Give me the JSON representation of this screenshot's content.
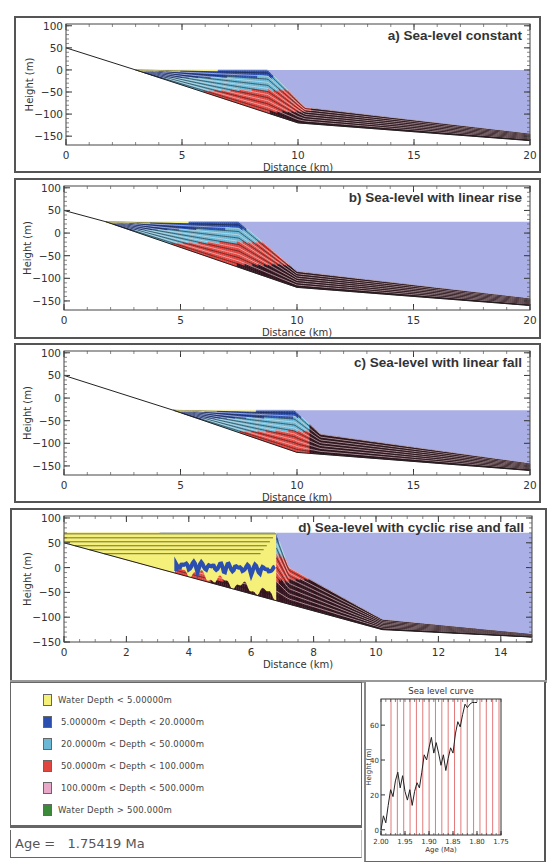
{
  "colors": {
    "sea": "#aab0e6",
    "very_shallow": "#f4f07a",
    "shallow": "#2b4fb0",
    "medium": "#6ab8d6",
    "deep": "#e0453f",
    "deeper": "#e8a8c8",
    "deepest": "#3a8a3a",
    "basin_dark": "#3a1420",
    "frame": "#555555"
  },
  "panels": [
    {
      "id": "a",
      "title": "a) Sea-level constant",
      "xlabel": "Distance (km)",
      "ylabel": "Height (m)",
      "xticks": [
        "0",
        "5",
        "10",
        "15",
        "20"
      ],
      "yticks": [
        "100",
        "50",
        "0",
        "-50",
        "-100",
        "-150"
      ]
    },
    {
      "id": "b",
      "title": "b) Sea-level with linear rise",
      "xlabel": "Distance (km)",
      "ylabel": "Height (m)",
      "xticks": [
        "0",
        "5",
        "10",
        "15",
        "20"
      ],
      "yticks": [
        "100",
        "50",
        "0",
        "-50",
        "-100",
        "-150"
      ]
    },
    {
      "id": "c",
      "title": "c) Sea-level with linear fall",
      "xlabel": "Distance (km)",
      "ylabel": "Height (m)",
      "xticks": [
        "0",
        "5",
        "10",
        "15",
        "20"
      ],
      "yticks": [
        "100",
        "50",
        "0",
        "-50",
        "-100",
        "-150"
      ]
    },
    {
      "id": "d",
      "title": "d) Sea-level with cyclic rise and fall",
      "xlabel": "Distance (km)",
      "ylabel": "Height (m)",
      "xticks": [
        "0",
        "2",
        "4",
        "6",
        "8",
        "10",
        "12",
        "14"
      ],
      "yticks": [
        "100",
        "50",
        "0",
        "-50",
        "-100",
        "-150"
      ]
    }
  ],
  "legend": {
    "items": [
      {
        "label": "Water Depth < 5.00000m",
        "color": "#f4f07a"
      },
      {
        "label": "5.00000m < Depth < 20.0000m",
        "color": "#2b4fb0"
      },
      {
        "label": "20.0000m < Depth < 50.0000m",
        "color": "#6ab8d6"
      },
      {
        "label": "50.0000m < Depth < 100.000m",
        "color": "#e0453f"
      },
      {
        "label": "100.000m < Depth < 500.000m",
        "color": "#e8a8c8"
      },
      {
        "label": "Water Depth > 500.000m",
        "color": "#3a8a3a"
      }
    ]
  },
  "age": {
    "label": "Age =",
    "value": "1.75419",
    "unit": "Ma"
  },
  "sea_level_curve": {
    "title": "Sea  level curve",
    "xlabel": "Age (Ma)",
    "ylabel": "Height (m)",
    "xticks": [
      "2.00",
      "1.95",
      "1.90",
      "1.85",
      "1.80",
      "1.75"
    ],
    "yticks": [
      "0",
      "20",
      "40",
      "60"
    ]
  },
  "chart_data": [
    {
      "type": "area",
      "title": "a) Sea-level constant",
      "xlabel": "Distance (km)",
      "ylabel": "Height (m)",
      "xlim": [
        0,
        20
      ],
      "ylim": [
        -170,
        105
      ],
      "sea_level_m": 0,
      "series": [
        {
          "name": "initial basement profile",
          "x": [
            0,
            3,
            10,
            20
          ],
          "y": [
            50,
            0,
            -120,
            -160
          ]
        },
        {
          "name": "clinoform front",
          "x": [
            3,
            8.7,
            10.3,
            20
          ],
          "y": [
            0,
            0,
            -85,
            -145
          ]
        }
      ],
      "legend_position": "none",
      "grid": false
    },
    {
      "type": "area",
      "title": "b) Sea-level with linear rise",
      "xlabel": "Distance (km)",
      "ylabel": "Height (m)",
      "xlim": [
        0,
        20
      ],
      "ylim": [
        -170,
        105
      ],
      "sea_level_m": 25,
      "series": [
        {
          "name": "initial basement profile",
          "x": [
            0,
            1.8,
            10,
            20
          ],
          "y": [
            50,
            25,
            -120,
            -160
          ]
        },
        {
          "name": "clinoform front",
          "x": [
            1.8,
            7.5,
            10,
            20
          ],
          "y": [
            25,
            25,
            -85,
            -145
          ]
        }
      ],
      "legend_position": "none",
      "grid": false
    },
    {
      "type": "area",
      "title": "c) Sea-level with linear fall",
      "xlabel": "Distance (km)",
      "ylabel": "Height (m)",
      "xlim": [
        0,
        20
      ],
      "ylim": [
        -170,
        105
      ],
      "sea_level_m": -27,
      "series": [
        {
          "name": "initial basement profile",
          "x": [
            0,
            4.7,
            10,
            20
          ],
          "y": [
            50,
            -27,
            -120,
            -160
          ]
        },
        {
          "name": "clinoform front",
          "x": [
            4.7,
            9.9,
            11,
            20
          ],
          "y": [
            -27,
            -27,
            -80,
            -145
          ]
        }
      ],
      "legend_position": "none",
      "grid": false
    },
    {
      "type": "area",
      "title": "d) Sea-level with cyclic rise and fall",
      "xlabel": "Distance (km)",
      "ylabel": "Height (m)",
      "xlim": [
        0,
        15
      ],
      "ylim": [
        -150,
        105
      ],
      "sea_level_m": 70,
      "series": [
        {
          "name": "initial basement profile",
          "x": [
            0,
            10.2,
            15
          ],
          "y": [
            50,
            -125,
            -140
          ]
        },
        {
          "name": "clinoform front",
          "x": [
            0,
            6.8,
            7.2,
            10.2,
            15
          ],
          "y": [
            70,
            70,
            0,
            -105,
            -135
          ]
        }
      ],
      "legend_position": "none",
      "grid": false
    },
    {
      "type": "line",
      "title": "Sea  level curve",
      "xlabel": "Age (Ma)",
      "ylabel": "Height (m)",
      "xlim": [
        2.0,
        1.75
      ],
      "ylim": [
        -3,
        75
      ],
      "x": [
        2.0,
        1.995,
        1.99,
        1.985,
        1.98,
        1.975,
        1.97,
        1.965,
        1.96,
        1.955,
        1.95,
        1.945,
        1.94,
        1.935,
        1.93,
        1.925,
        1.92,
        1.915,
        1.91,
        1.905,
        1.9,
        1.895,
        1.89,
        1.885,
        1.88,
        1.875,
        1.87,
        1.865,
        1.86,
        1.855,
        1.85,
        1.845,
        1.84,
        1.835,
        1.83,
        1.825,
        1.82,
        1.815,
        1.81,
        1.805,
        1.8,
        1.795,
        1.79,
        1.785,
        1.78,
        1.775,
        1.77,
        1.765,
        1.76,
        1.755,
        1.75
      ],
      "values": [
        0,
        8,
        4,
        14,
        23,
        19,
        28,
        33,
        24,
        31,
        22,
        17,
        23,
        14,
        22,
        27,
        24,
        33,
        43,
        40,
        47,
        53,
        44,
        50,
        44,
        37,
        43,
        34,
        41,
        47,
        44,
        55,
        62,
        59,
        66,
        72,
        70,
        72,
        73,
        73,
        73,
        73,
        73,
        73,
        73,
        73,
        73,
        73,
        73,
        73,
        73
      ],
      "vertical_markers_count": 18,
      "legend_position": "none",
      "grid": false
    }
  ]
}
